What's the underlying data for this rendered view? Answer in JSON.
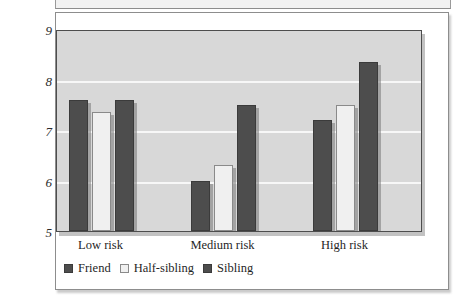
{
  "chart_data": {
    "type": "bar",
    "title": "",
    "subtitle": "",
    "xlabel": "",
    "ylabel": "",
    "categories": [
      "Low risk",
      "Medium risk",
      "High risk"
    ],
    "series": [
      {
        "name": "Friend",
        "values": [
          7.6,
          6.0,
          7.2
        ],
        "color": "#4d4d4d",
        "style": "filled-dark"
      },
      {
        "name": "Half-sibling",
        "values": [
          7.35,
          6.3,
          7.5
        ],
        "color": "#f0f0f0",
        "style": "outlined-light"
      },
      {
        "name": "Sibling",
        "values": [
          7.6,
          7.5,
          8.35
        ],
        "color": "#4d4d4d",
        "style": "filled-dark"
      }
    ],
    "ylim": [
      5,
      9
    ],
    "yticks": [
      "5",
      "6",
      "7",
      "8",
      "9"
    ],
    "ytick_values": [
      5,
      6,
      7,
      8,
      9
    ],
    "grid": true,
    "gridline_values": [
      6,
      7,
      8
    ],
    "legend_position": "bottom-left",
    "plot_background": "#d8d8d8",
    "gridline_color": "#f7f7f7",
    "figure_background": "#ffffff"
  },
  "legend": {
    "items": [
      {
        "label": "Friend"
      },
      {
        "label": "Half-sibling"
      },
      {
        "label": "Sibling"
      }
    ]
  },
  "axes": {
    "y_ticks": [
      {
        "label": "9"
      },
      {
        "label": "8"
      },
      {
        "label": "7"
      },
      {
        "label": "6"
      },
      {
        "label": "5"
      }
    ],
    "x_ticks": [
      {
        "label": "Low risk"
      },
      {
        "label": "Medium risk"
      },
      {
        "label": "High risk"
      }
    ]
  }
}
